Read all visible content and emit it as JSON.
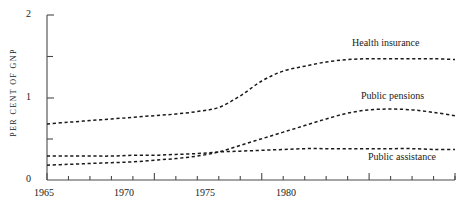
{
  "chart_data": {
    "type": "line",
    "title": "",
    "xlabel": "",
    "ylabel": "PER CENT OF GNP",
    "xlim": [
      1965,
      1984
    ],
    "ylim": [
      0,
      2
    ],
    "yticks": [
      0,
      1,
      2
    ],
    "ytick_labels": [
      "0",
      "1",
      "2"
    ],
    "yminor_ticks": [
      0.5,
      1.5
    ],
    "xticks": [
      1965,
      1966,
      1967,
      1968,
      1969,
      1970,
      1971,
      1972,
      1973,
      1974,
      1975,
      1976,
      1977,
      1978,
      1979,
      1980,
      1981,
      1982,
      1983,
      1984
    ],
    "xtick_labels": [
      "1965",
      "1970",
      "1975",
      "1980"
    ],
    "xtick_label_years": [
      1965,
      1970,
      1975,
      1980
    ],
    "grid": false,
    "legend_position": "inline-right",
    "linestyle": "dashed",
    "line_color": "#1a1a1a",
    "background": "#ffffff",
    "x": [
      1965,
      1966,
      1967,
      1968,
      1969,
      1970,
      1971,
      1972,
      1973,
      1974,
      1975,
      1976,
      1977,
      1978,
      1979,
      1980,
      1981,
      1982,
      1983,
      1984
    ],
    "series": [
      {
        "name": "Health insurance",
        "values": [
          0.68,
          0.7,
          0.72,
          0.74,
          0.76,
          0.78,
          0.8,
          0.83,
          0.88,
          1.02,
          1.2,
          1.32,
          1.38,
          1.43,
          1.46,
          1.47,
          1.47,
          1.47,
          1.47,
          1.46
        ]
      },
      {
        "name": "Public pensions",
        "values": [
          0.18,
          0.19,
          0.2,
          0.21,
          0.22,
          0.24,
          0.26,
          0.29,
          0.34,
          0.42,
          0.5,
          0.58,
          0.66,
          0.74,
          0.81,
          0.85,
          0.86,
          0.85,
          0.82,
          0.78
        ]
      },
      {
        "name": "Public assistance",
        "values": [
          0.29,
          0.29,
          0.29,
          0.29,
          0.3,
          0.3,
          0.31,
          0.32,
          0.34,
          0.35,
          0.36,
          0.37,
          0.38,
          0.38,
          0.38,
          0.38,
          0.38,
          0.38,
          0.37,
          0.37
        ]
      }
    ],
    "annotations": [
      {
        "text": "Health insurance",
        "near_year": 1981,
        "near_value": 1.6
      },
      {
        "text": "Public pensions",
        "near_year": 1981,
        "near_value": 0.97
      },
      {
        "text": "Public assistance",
        "near_year": 1982,
        "near_value": 0.23
      }
    ]
  }
}
